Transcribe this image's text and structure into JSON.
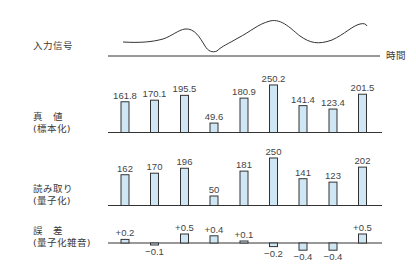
{
  "labels": {
    "input_signal": "入力信号",
    "time_axis": "時間",
    "true_value": "真　値\n(標本化)",
    "reading": "読み取り\n(量子化)",
    "error": "誤　差\n(量子化雑音)"
  },
  "colors": {
    "bar_fill": "#cfe6f5",
    "bar_stroke": "#333333",
    "line": "#333333"
  },
  "chart_data": [
    {
      "type": "line",
      "title": "入力信号",
      "xlabel": "時間",
      "description": "Continuous analog input waveform over time with a dip, rising peak, trough and rising end"
    },
    {
      "type": "bar",
      "title": "真値 (標本化)",
      "categories": [
        "1",
        "2",
        "3",
        "4",
        "5",
        "6",
        "7",
        "8",
        "9"
      ],
      "values": [
        161.8,
        170.1,
        195.5,
        49.6,
        180.9,
        250.2,
        141.4,
        123.4,
        201.5
      ],
      "labels": [
        "161.8",
        "170.1",
        "195.5",
        "49.6",
        "180.9",
        "250.2",
        "141.4",
        "123.4",
        "201.5"
      ]
    },
    {
      "type": "bar",
      "title": "読み取り (量子化)",
      "categories": [
        "1",
        "2",
        "3",
        "4",
        "5",
        "6",
        "7",
        "8",
        "9"
      ],
      "values": [
        162,
        170,
        196,
        50,
        181,
        250,
        141,
        123,
        202
      ],
      "labels": [
        "162",
        "170",
        "196",
        "50",
        "181",
        "250",
        "141",
        "123",
        "202"
      ]
    },
    {
      "type": "bar",
      "title": "誤差 (量子化雑音)",
      "categories": [
        "1",
        "2",
        "3",
        "4",
        "5",
        "6",
        "7",
        "8",
        "9"
      ],
      "values": [
        0.2,
        -0.1,
        0.5,
        0.4,
        0.1,
        -0.2,
        -0.4,
        -0.4,
        0.5
      ],
      "labels": [
        "+0.2",
        "−0.1",
        "+0.5",
        "+0.4",
        "+0.1",
        "−0.2",
        "−0.4",
        "−0.4",
        "+0.5"
      ]
    }
  ]
}
